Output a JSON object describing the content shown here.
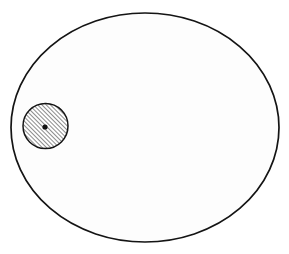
{
  "figure": {
    "background_color": "#ffffff",
    "width": 289,
    "height": 254,
    "stroke_color": "#141414",
    "fill_color": "#fdfdfd"
  },
  "chart_data": {
    "type": "diagram",
    "title": "",
    "xlabel": "",
    "ylabel": "",
    "grid": false,
    "legend": "none",
    "xlim": [
      0,
      289
    ],
    "ylim": [
      0,
      254
    ],
    "shapes": [
      {
        "name": "outer-ellipse",
        "kind": "ellipse",
        "cx": 145,
        "cy": 127.5,
        "rx": 134,
        "ry": 114.5,
        "fill": "#fdfdfd",
        "stroke": "#141414",
        "stroke_width": 1.7,
        "hatched": false,
        "label": ""
      },
      {
        "name": "inner-circle",
        "kind": "circle",
        "cx": 45.5,
        "cy": 126,
        "rx": 22.5,
        "ry": 22.5,
        "fill": "#ffffff",
        "stroke": "#141414",
        "stroke_width": 1.5,
        "hatched": true,
        "hatch_angle_deg": 45,
        "hatch_spacing": 3,
        "hatch_stroke_width": 1.0,
        "hatch_color": "#1a1a1a",
        "label": ""
      },
      {
        "name": "center-dot",
        "kind": "circle",
        "cx": 45,
        "cy": 127,
        "rx": 2.6,
        "ry": 2.6,
        "fill": "#111111",
        "stroke": "none",
        "stroke_width": 0,
        "hatched": false,
        "label": ""
      }
    ],
    "annotations": [],
    "tick_labels": []
  }
}
